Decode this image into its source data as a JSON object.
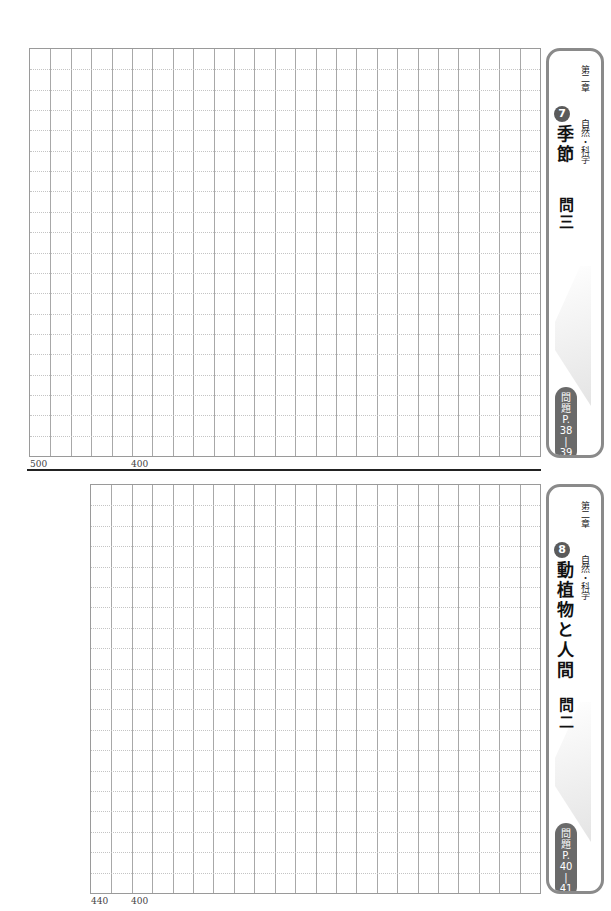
{
  "sheets": [
    {
      "id": "sheet-top",
      "grid": {
        "columns": 25,
        "rows": 20
      },
      "counters": [
        {
          "label": "500"
        },
        {
          "label": "400"
        }
      ],
      "tab": {
        "chapter": "第二章",
        "unit_number": "7",
        "subject": "自然・科学",
        "title": "季節",
        "question": "問三",
        "page_ref": [
          "問",
          "題",
          "P.",
          "38",
          "|",
          "39"
        ]
      }
    },
    {
      "id": "sheet-bottom",
      "grid": {
        "columns": 22,
        "rows": 20
      },
      "counters": [
        {
          "label": "440"
        },
        {
          "label": "400"
        }
      ],
      "tab": {
        "chapter": "第二章",
        "unit_number": "8",
        "subject": "自然・科学",
        "title": "動植物と人間",
        "question": "問二",
        "page_ref": [
          "問",
          "題",
          "P.",
          "40",
          "|",
          "41"
        ]
      }
    }
  ],
  "colors": {
    "grid_border": "#9a9a9a",
    "grid_line": "#a8a8a8",
    "dotted_line": "#c4c4c4",
    "tab_border": "#8a8a8a",
    "badge": "#5b5b5b",
    "separator": "#222222"
  }
}
